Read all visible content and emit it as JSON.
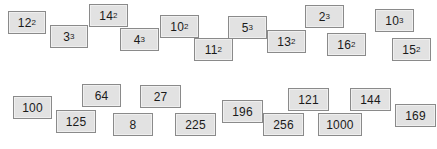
{
  "page": {
    "background_color": "#ffffff",
    "card_fill_color": "#e2e2e2",
    "card_border_color": "#8a8a8a",
    "text_color": "#1a1a1a"
  },
  "rows": [
    {
      "name": "powers-row",
      "cards": [
        {
          "name": "card-12-squared",
          "base": "12",
          "exponent": "2",
          "text": "12²",
          "x": 8,
          "y": 11,
          "w": 38,
          "h": 23
        },
        {
          "name": "card-3-cubed",
          "base": "3",
          "exponent": "3",
          "text": "3³",
          "x": 50,
          "y": 25,
          "w": 38,
          "h": 23
        },
        {
          "name": "card-14-squared",
          "base": "14",
          "exponent": "2",
          "text": "14²",
          "x": 89,
          "y": 4,
          "w": 39,
          "h": 23
        },
        {
          "name": "card-4-cubed",
          "base": "4",
          "exponent": "3",
          "text": "4³",
          "x": 120,
          "y": 28,
          "w": 39,
          "h": 23
        },
        {
          "name": "card-10-squared",
          "base": "10",
          "exponent": "2",
          "text": "10²",
          "x": 160,
          "y": 15,
          "w": 39,
          "h": 23
        },
        {
          "name": "card-11-squared",
          "base": "11",
          "exponent": "2",
          "text": "11²",
          "x": 194,
          "y": 38,
          "w": 39,
          "h": 23
        },
        {
          "name": "card-5-cubed",
          "base": "5",
          "exponent": "3",
          "text": "5³",
          "x": 228,
          "y": 16,
          "w": 39,
          "h": 23
        },
        {
          "name": "card-13-squared",
          "base": "13",
          "exponent": "2",
          "text": "13²",
          "x": 267,
          "y": 30,
          "w": 39,
          "h": 23
        },
        {
          "name": "card-2-cubed",
          "base": "2",
          "exponent": "3",
          "text": "2³",
          "x": 305,
          "y": 5,
          "w": 39,
          "h": 23
        },
        {
          "name": "card-16-squared",
          "base": "16",
          "exponent": "2",
          "text": "16²",
          "x": 327,
          "y": 33,
          "w": 39,
          "h": 23
        },
        {
          "name": "card-10-cubed",
          "base": "10",
          "exponent": "3",
          "text": "10³",
          "x": 375,
          "y": 9,
          "w": 39,
          "h": 23
        },
        {
          "name": "card-15-squared",
          "base": "15",
          "exponent": "2",
          "text": "15²",
          "x": 392,
          "y": 38,
          "w": 39,
          "h": 23
        }
      ]
    },
    {
      "name": "values-row",
      "cards": [
        {
          "name": "card-100",
          "base": "100",
          "exponent": "",
          "text": "100",
          "x": 13,
          "y": 96,
          "w": 39,
          "h": 23
        },
        {
          "name": "card-125",
          "base": "125",
          "exponent": "",
          "text": "125",
          "x": 56,
          "y": 110,
          "w": 40,
          "h": 23
        },
        {
          "name": "card-64",
          "base": "64",
          "exponent": "",
          "text": "64",
          "x": 82,
          "y": 84,
          "w": 39,
          "h": 23
        },
        {
          "name": "card-8",
          "base": "8",
          "exponent": "",
          "text": "8",
          "x": 113,
          "y": 113,
          "w": 40,
          "h": 23
        },
        {
          "name": "card-27",
          "base": "27",
          "exponent": "",
          "text": "27",
          "x": 140,
          "y": 85,
          "w": 41,
          "h": 23
        },
        {
          "name": "card-225",
          "base": "225",
          "exponent": "",
          "text": "225",
          "x": 175,
          "y": 113,
          "w": 41,
          "h": 23
        },
        {
          "name": "card-196",
          "base": "196",
          "exponent": "",
          "text": "196",
          "x": 222,
          "y": 100,
          "w": 41,
          "h": 23
        },
        {
          "name": "card-256",
          "base": "256",
          "exponent": "",
          "text": "256",
          "x": 263,
          "y": 113,
          "w": 41,
          "h": 23
        },
        {
          "name": "card-121",
          "base": "121",
          "exponent": "",
          "text": "121",
          "x": 288,
          "y": 88,
          "w": 41,
          "h": 23
        },
        {
          "name": "card-1000",
          "base": "1000",
          "exponent": "",
          "text": "1000",
          "x": 318,
          "y": 113,
          "w": 44,
          "h": 23
        },
        {
          "name": "card-144",
          "base": "144",
          "exponent": "",
          "text": "144",
          "x": 350,
          "y": 88,
          "w": 41,
          "h": 23
        },
        {
          "name": "card-169",
          "base": "169",
          "exponent": "",
          "text": "169",
          "x": 395,
          "y": 104,
          "w": 41,
          "h": 23
        }
      ]
    }
  ]
}
